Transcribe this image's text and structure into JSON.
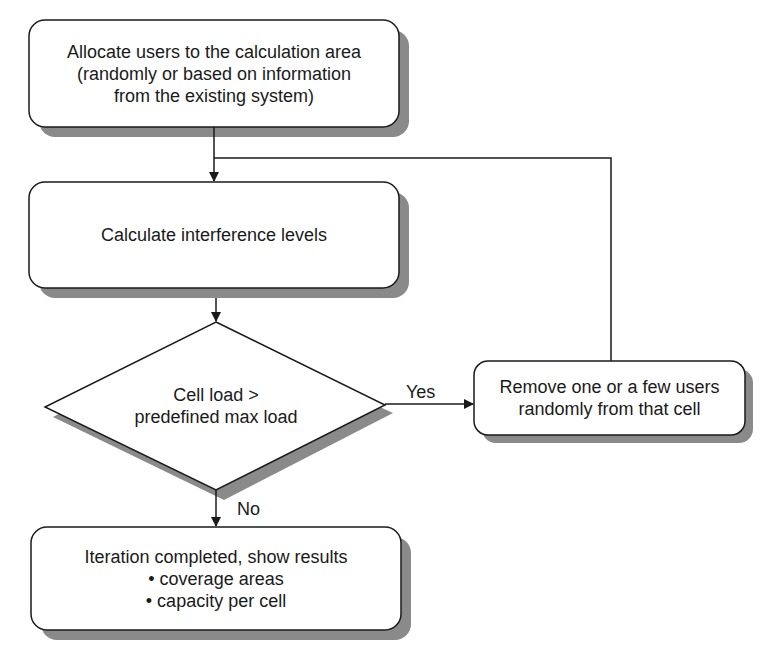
{
  "diagram": {
    "type": "flowchart",
    "nodes": {
      "allocate": {
        "shape": "rounded-rect",
        "lines": [
          "Allocate users to the calculation area",
          "(randomly or based on information",
          "from the existing system)"
        ]
      },
      "calculate": {
        "shape": "rounded-rect",
        "lines": [
          "Calculate interference levels"
        ]
      },
      "decision": {
        "shape": "diamond",
        "lines": [
          "Cell load >",
          "predefined max load"
        ]
      },
      "remove": {
        "shape": "rounded-rect",
        "lines": [
          "Remove one or a few users",
          "randomly from that cell"
        ]
      },
      "results": {
        "shape": "rounded-rect",
        "title": "Iteration completed, show results",
        "bullets": [
          "• coverage areas",
          "• capacity per cell"
        ]
      }
    },
    "edges": [
      {
        "from": "allocate",
        "to": "calculate",
        "label": ""
      },
      {
        "from": "calculate",
        "to": "decision",
        "label": ""
      },
      {
        "from": "decision",
        "to": "remove",
        "label": "Yes"
      },
      {
        "from": "remove",
        "to": "calculate",
        "label": ""
      },
      {
        "from": "decision",
        "to": "results",
        "label": "No"
      }
    ],
    "labels": {
      "yes": "Yes",
      "no": "No"
    },
    "colors": {
      "stroke": "#1a1a1a",
      "shadow": "#8a8a8a",
      "fill": "#ffffff"
    }
  }
}
